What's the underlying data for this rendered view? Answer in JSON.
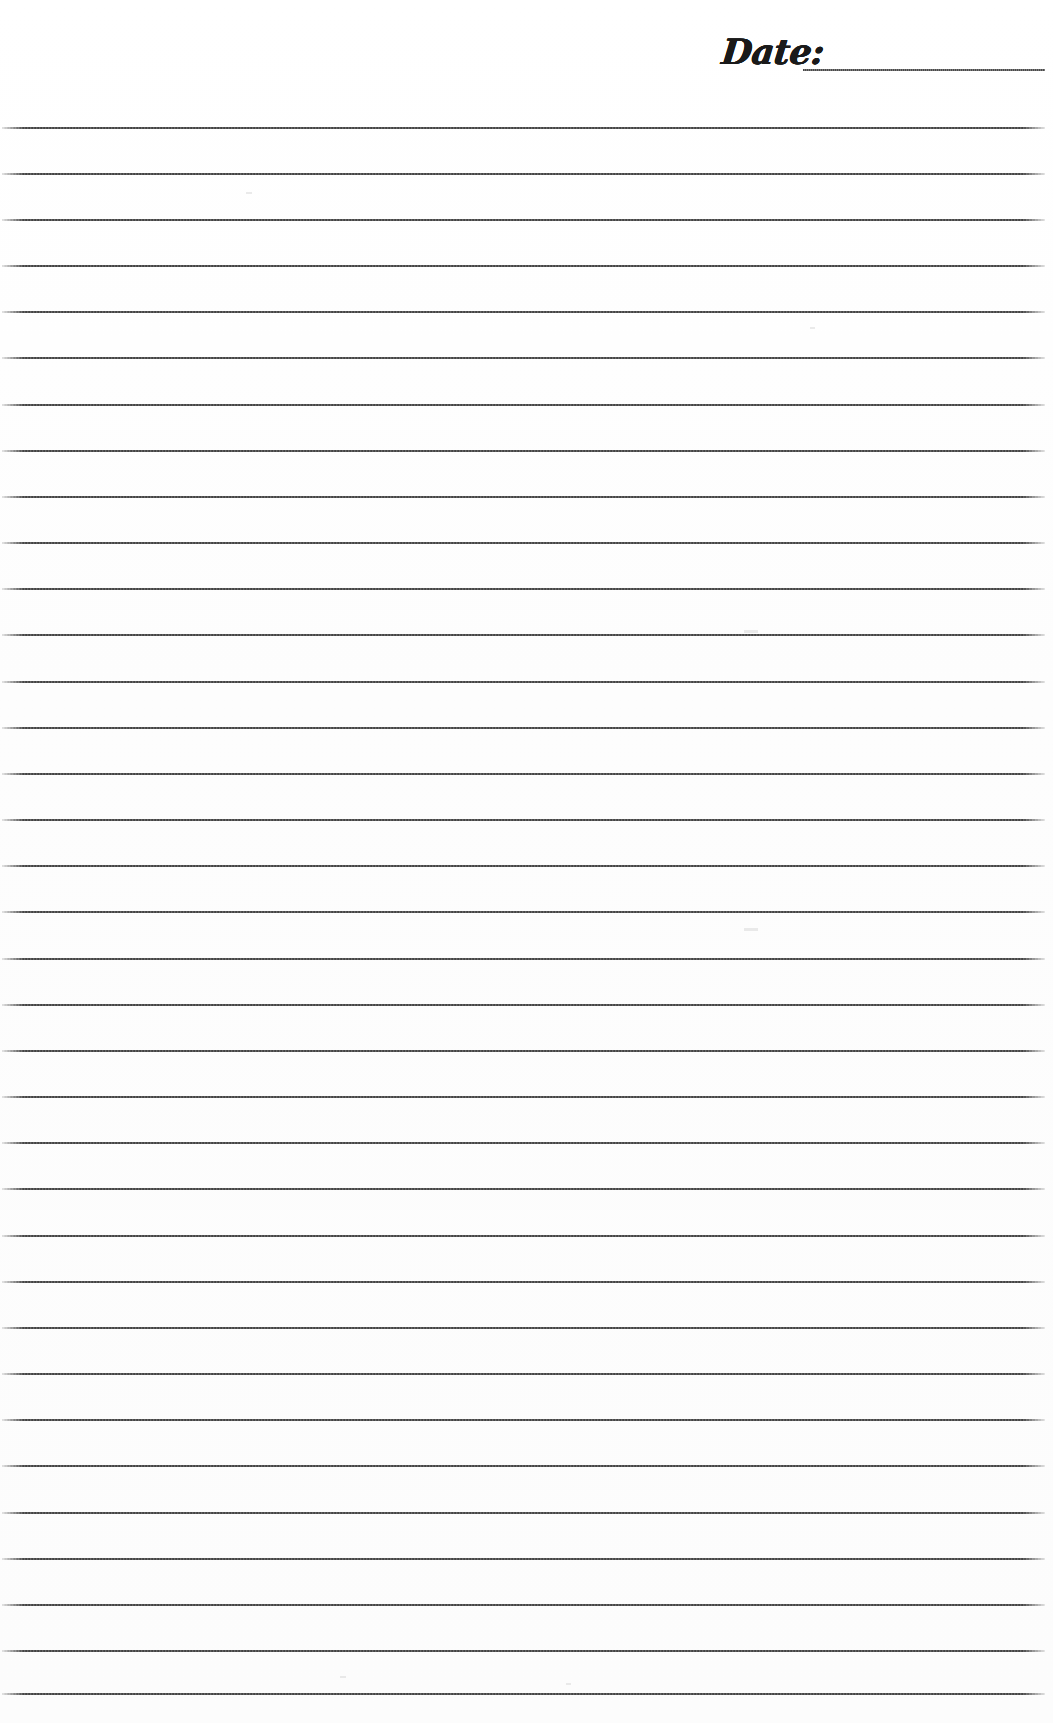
{
  "page": {
    "width": 1053,
    "height": 1723,
    "background_color": "#fefefe",
    "paper_tone": "#fdfdfd"
  },
  "header": {
    "date_label": "Date:",
    "date_value": "",
    "date_field_placeholder": "",
    "label_left": 722,
    "label_top": 30,
    "label_font_size": 35,
    "label_color": "#1a1a1a",
    "rule_left": 803,
    "rule_top": 69,
    "rule_width": 242
  },
  "ruling": {
    "line_color": "#3a3a3a",
    "line_thickness_px": 2,
    "line_left": 2,
    "line_width": 1043,
    "first_line_y": 127,
    "line_spacing_px": 46.1,
    "line_count": 35,
    "line_positions": [
      127,
      173,
      219,
      265,
      311,
      357,
      404,
      450,
      496,
      542,
      588,
      634,
      681,
      727,
      773,
      819,
      865,
      911,
      958,
      1004,
      1050,
      1096,
      1142,
      1188,
      1235,
      1281,
      1327,
      1373,
      1419,
      1465,
      1512,
      1558,
      1604,
      1650,
      1693
    ]
  },
  "specks": [
    {
      "x": 744,
      "y": 630,
      "w": 14,
      "h": 3
    },
    {
      "x": 744,
      "y": 928,
      "w": 14,
      "h": 3
    },
    {
      "x": 246,
      "y": 192,
      "w": 6,
      "h": 2
    },
    {
      "x": 810,
      "y": 327,
      "w": 5,
      "h": 2
    },
    {
      "x": 340,
      "y": 1676,
      "w": 6,
      "h": 2
    },
    {
      "x": 566,
      "y": 1683,
      "w": 5,
      "h": 2
    }
  ]
}
